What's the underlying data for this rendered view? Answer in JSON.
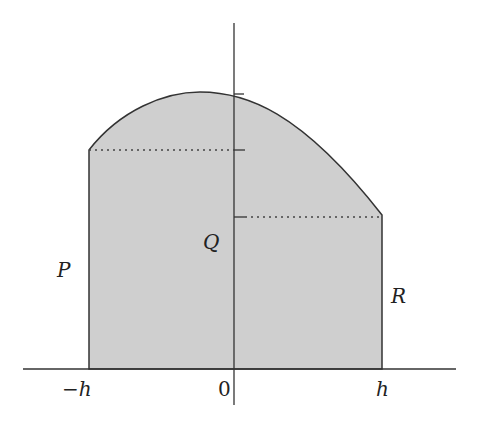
{
  "diagram": {
    "type": "area-under-curve",
    "labels": {
      "P": "P",
      "Q": "Q",
      "R": "R",
      "x_minus_h": "−h",
      "x_zero": "0",
      "x_h": "h"
    },
    "colors": {
      "fill": "#cfcfcf",
      "stroke": "#333333"
    }
  }
}
